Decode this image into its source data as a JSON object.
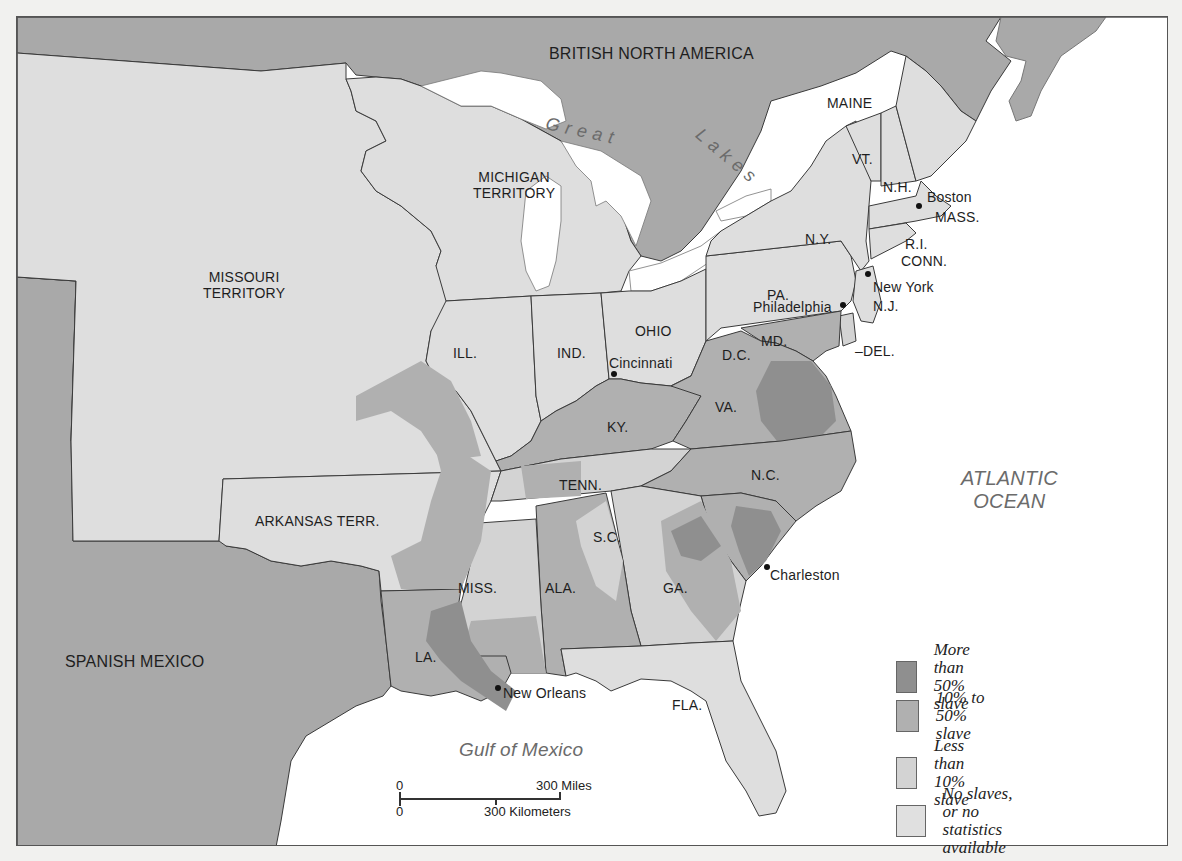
{
  "map": {
    "title": "",
    "regions": {
      "british_north_america": "BRITISH NORTH AMERICA",
      "great": "Great",
      "lakes": "Lakes",
      "michigan_territory": [
        "MICHIGAN",
        "TERRITORY"
      ],
      "missouri_territory": [
        "MISSOURI",
        "TERRITORY"
      ],
      "maine": "MAINE",
      "vt": "VT.",
      "nh": "N.H.",
      "ny": "N.Y.",
      "mass": "MASS.",
      "ri": "R.I.",
      "conn": "CONN.",
      "nj": "N.J.",
      "pa": "PA.",
      "md": "MD.",
      "dc": "D.C.",
      "del": "–DEL.",
      "ill": "ILL.",
      "ind": "IND.",
      "ohio": "OHIO",
      "ky": "KY.",
      "va": "VA.",
      "nc": "N.C.",
      "tenn": "TENN.",
      "sc": "S.C.",
      "ga": "GA.",
      "ala": "ALA.",
      "miss": "MISS.",
      "la": "LA.",
      "fla": "FLA.",
      "arkansas_terr": "ARKANSAS TERR.",
      "spanish_mexico": "SPANISH MEXICO"
    },
    "water": {
      "atlantic": [
        "ATLANTIC",
        "OCEAN"
      ],
      "gulf": "Gulf of Mexico"
    },
    "cities": {
      "boston": "Boston",
      "new_york": "New York",
      "philadelphia": "Philadelphia",
      "cincinnati": "Cincinnati",
      "charleston": "Charleston",
      "new_orleans": "New Orleans"
    },
    "scale": {
      "zero_miles": "0",
      "miles": "300 Miles",
      "zero_km": "0",
      "km": "300 Kilometers"
    },
    "legend": [
      {
        "label": "More than 50% slave",
        "color": "#8f8f8f"
      },
      {
        "label": "10% to 50% slave",
        "color": "#b0b0b0"
      },
      {
        "label": "Less than 10% slave",
        "color": "#d3d3d3"
      },
      {
        "label_line1": "No slaves, or no",
        "label_line2": "statistics available",
        "color": "#e0e0e0"
      }
    ],
    "colors": {
      "foreign": "#a9a9a9",
      "no_slaves": "#dedede",
      "less_10": "#d3d3d3",
      "p10_50": "#b0b0b0",
      "more_50": "#8f8f8f",
      "water": "#ffffff",
      "border": "#3a3a3a"
    }
  }
}
